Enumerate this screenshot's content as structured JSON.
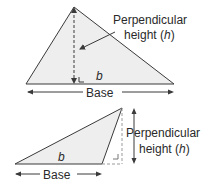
{
  "diagram": {
    "colors": {
      "fill": "#eeeeee",
      "stroke": "#3a3a3a",
      "text": "#2a2a2a"
    },
    "top_triangle": {
      "height_label_line1": "Perpendicular",
      "height_label_line2_prefix": "height (",
      "height_label_var": "h",
      "height_label_line2_suffix": ")",
      "base_var_label": "b",
      "base_label": "Base"
    },
    "bottom_triangle": {
      "height_label_line1": "Perpendicular",
      "height_label_line2_prefix": "height (",
      "height_label_var": "h",
      "height_label_line2_suffix": ")",
      "base_var_label": "b",
      "base_label": "Base"
    }
  }
}
